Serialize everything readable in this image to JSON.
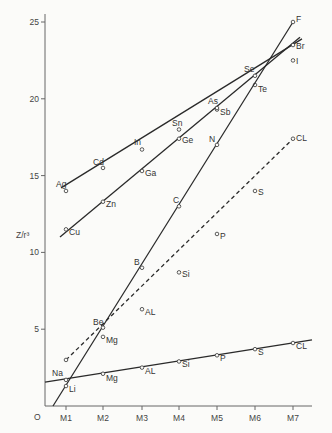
{
  "chart_data": {
    "type": "line",
    "title": "",
    "xlabel": "",
    "ylabel": "Z/r³",
    "origin_label": "O",
    "categories": [
      "M1",
      "M2",
      "M3",
      "M4",
      "M5",
      "M6",
      "M7"
    ],
    "ylim": [
      0,
      25
    ],
    "yticks": [
      5,
      10,
      15,
      20,
      25
    ],
    "grid": false,
    "legend": "none (point labels inline)",
    "series": [
      {
        "name": "Ag-I row",
        "style": "solid",
        "labels": [
          "Ag",
          "Cd",
          "In",
          "Sn",
          "Sb",
          "Te",
          "I"
        ],
        "values": [
          14.0,
          15.5,
          16.7,
          18.0,
          19.3,
          20.9,
          22.5
        ]
      },
      {
        "name": "Cu-Br row",
        "style": "solid",
        "labels": [
          "Cu",
          "Zn",
          "Ga",
          "Ge",
          "As",
          "Se",
          "Br"
        ],
        "values": [
          11.5,
          13.3,
          15.3,
          17.4,
          19.4,
          21.5,
          23.5
        ]
      },
      {
        "name": "Li-F row",
        "style": "solid",
        "labels": [
          "Li",
          "Be",
          "B",
          "C",
          "N",
          "",
          "F"
        ],
        "values": [
          1.3,
          5.1,
          9.0,
          13.0,
          17.0,
          null,
          25.0
        ]
      },
      {
        "name": "Na-CL row (dashed)",
        "style": "dashed",
        "labels": [
          "",
          "Mg",
          "AL",
          "Si",
          "P",
          "S",
          "CL"
        ],
        "values": [
          3.0,
          4.5,
          6.3,
          8.7,
          11.2,
          14.0,
          17.4
        ]
      },
      {
        "name": "Na-CL row (lower)",
        "style": "solid",
        "labels": [
          "Na",
          "Mg",
          "AL",
          "Si",
          "P",
          "S",
          "CL"
        ],
        "values": [
          1.7,
          2.1,
          2.5,
          2.9,
          3.3,
          3.7,
          4.1
        ]
      }
    ]
  }
}
